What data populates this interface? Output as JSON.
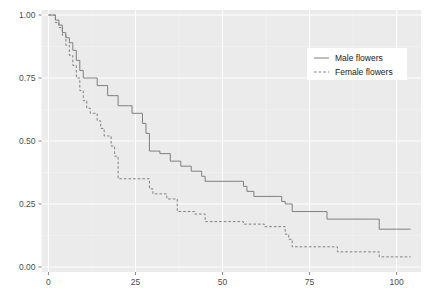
{
  "chart_data": {
    "type": "line",
    "subtype": "kaplan-meier-step",
    "title": "",
    "subtitle": "",
    "xlabel": "",
    "ylabel": "",
    "xlim": [
      -2,
      107
    ],
    "ylim": [
      -0.02,
      1.02
    ],
    "xticks": [
      0,
      25,
      50,
      75,
      100
    ],
    "xtick_labels": [
      "0",
      "25",
      "50",
      "75",
      "100"
    ],
    "yticks": [
      0.0,
      0.25,
      0.5,
      0.75,
      1.0
    ],
    "ytick_labels": [
      "0.00",
      "0.25",
      "0.50",
      "0.75",
      "1.00"
    ],
    "grid": true,
    "grid_major_color": "#ffffff",
    "grid_minor_color": "#f2f2f2",
    "panel_background": "#ebebeb",
    "legend_position": "top-right-inside",
    "legend_background": "#ffffff",
    "series": [
      {
        "name": "Male flowers",
        "linestyle": "solid",
        "color": "#7f7f7f",
        "points": [
          [
            0,
            1.0
          ],
          [
            1,
            1.0
          ],
          [
            2,
            0.98
          ],
          [
            3,
            0.96
          ],
          [
            4,
            0.93
          ],
          [
            5,
            0.91
          ],
          [
            6,
            0.89
          ],
          [
            7,
            0.86
          ],
          [
            8,
            0.82
          ],
          [
            9,
            0.78
          ],
          [
            10,
            0.75
          ],
          [
            13,
            0.75
          ],
          [
            14,
            0.72
          ],
          [
            16,
            0.72
          ],
          [
            17,
            0.68
          ],
          [
            19,
            0.68
          ],
          [
            20,
            0.64
          ],
          [
            23,
            0.64
          ],
          [
            24,
            0.61
          ],
          [
            26,
            0.61
          ],
          [
            27,
            0.57
          ],
          [
            28,
            0.53
          ],
          [
            29,
            0.46
          ],
          [
            31,
            0.46
          ],
          [
            32,
            0.45
          ],
          [
            34,
            0.45
          ],
          [
            35,
            0.42
          ],
          [
            37,
            0.42
          ],
          [
            38,
            0.4
          ],
          [
            40,
            0.4
          ],
          [
            41,
            0.38
          ],
          [
            43,
            0.38
          ],
          [
            44,
            0.36
          ],
          [
            45,
            0.34
          ],
          [
            55,
            0.34
          ],
          [
            56,
            0.32
          ],
          [
            57,
            0.3
          ],
          [
            59,
            0.28
          ],
          [
            66,
            0.28
          ],
          [
            67,
            0.26
          ],
          [
            68,
            0.25
          ],
          [
            69,
            0.25
          ],
          [
            70,
            0.22
          ],
          [
            79,
            0.22
          ],
          [
            80,
            0.19
          ],
          [
            94,
            0.19
          ],
          [
            95,
            0.15
          ],
          [
            104,
            0.15
          ]
        ]
      },
      {
        "name": "Female flowers",
        "linestyle": "dashed",
        "color": "#7f7f7f",
        "points": [
          [
            0,
            1.0
          ],
          [
            1,
            1.0
          ],
          [
            2,
            0.97
          ],
          [
            3,
            0.95
          ],
          [
            4,
            0.92
          ],
          [
            5,
            0.88
          ],
          [
            6,
            0.84
          ],
          [
            7,
            0.8
          ],
          [
            8,
            0.75
          ],
          [
            9,
            0.7
          ],
          [
            10,
            0.66
          ],
          [
            11,
            0.63
          ],
          [
            12,
            0.61
          ],
          [
            13,
            0.61
          ],
          [
            14,
            0.58
          ],
          [
            15,
            0.55
          ],
          [
            16,
            0.52
          ],
          [
            17,
            0.52
          ],
          [
            18,
            0.48
          ],
          [
            19,
            0.44
          ],
          [
            20,
            0.35
          ],
          [
            27,
            0.35
          ],
          [
            28,
            0.35
          ],
          [
            29,
            0.31
          ],
          [
            30,
            0.29
          ],
          [
            33,
            0.29
          ],
          [
            34,
            0.27
          ],
          [
            36,
            0.27
          ],
          [
            37,
            0.22
          ],
          [
            41,
            0.22
          ],
          [
            42,
            0.21
          ],
          [
            44,
            0.21
          ],
          [
            45,
            0.18
          ],
          [
            54,
            0.18
          ],
          [
            55,
            0.18
          ],
          [
            56,
            0.17
          ],
          [
            61,
            0.17
          ],
          [
            62,
            0.16
          ],
          [
            67,
            0.16
          ],
          [
            68,
            0.13
          ],
          [
            69,
            0.11
          ],
          [
            70,
            0.08
          ],
          [
            82,
            0.08
          ],
          [
            83,
            0.06
          ],
          [
            94,
            0.06
          ],
          [
            95,
            0.04
          ],
          [
            104,
            0.04
          ]
        ]
      }
    ]
  },
  "legend": {
    "items": [
      {
        "label": "Male flowers",
        "linestyle": "solid"
      },
      {
        "label": "Female flowers",
        "linestyle": "dashed"
      }
    ]
  }
}
